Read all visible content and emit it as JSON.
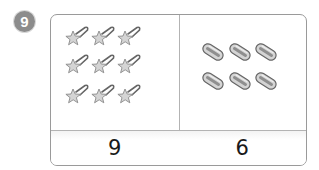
{
  "question": {
    "number": "9",
    "badge_color": "#8c8c8c"
  },
  "panels": [
    {
      "item": "star-hairclip",
      "count_shown": 9,
      "answer": "9",
      "positions": [
        [
          26,
          22
        ],
        [
          52,
          22
        ],
        [
          78,
          22
        ],
        [
          26,
          50
        ],
        [
          52,
          50
        ],
        [
          78,
          50
        ],
        [
          26,
          80
        ],
        [
          52,
          80
        ],
        [
          78,
          80
        ]
      ]
    },
    {
      "item": "capsule-bead",
      "count_shown": 6,
      "answer": "6",
      "positions": [
        [
          162,
          39
        ],
        [
          189,
          39
        ],
        [
          215,
          39
        ],
        [
          162,
          68
        ],
        [
          189,
          68
        ],
        [
          215,
          68
        ]
      ]
    }
  ],
  "colors": {
    "border": "#9a9a9a",
    "divider": "#b3b3b3",
    "icon_fill": "#d4d4d4",
    "icon_stroke": "#666666"
  }
}
